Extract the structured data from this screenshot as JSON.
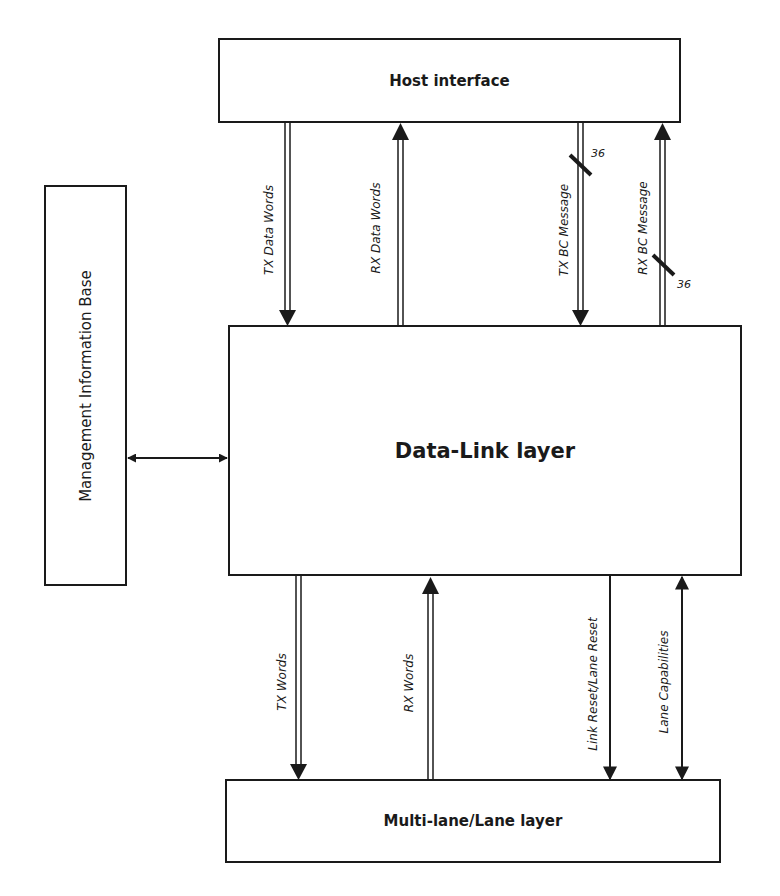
{
  "blocks": {
    "host_interface": "Host interface",
    "data_link_layer": "Data-Link layer",
    "multi_lane_layer": "Multi-lane/Lane layer",
    "management_information_base": "Management Information Base"
  },
  "signals_top": [
    {
      "label": "TX Data Words",
      "direction": "down",
      "style": "double-line"
    },
    {
      "label": "RX Data Words",
      "direction": "up",
      "style": "double-line"
    },
    {
      "label": "TX BC Message",
      "direction": "down",
      "style": "double-line",
      "bus_width": "36"
    },
    {
      "label": "RX BC Message",
      "direction": "up",
      "style": "double-line",
      "bus_width": "36"
    }
  ],
  "signals_bottom": [
    {
      "label": "TX Words",
      "direction": "down",
      "style": "double-line"
    },
    {
      "label": "RX Words",
      "direction": "up",
      "style": "double-line"
    },
    {
      "label": "Link Reset/Lane Reset",
      "direction": "down",
      "style": "single-line"
    },
    {
      "label": "Lane Capabilities",
      "direction": "bidirectional",
      "style": "single-line"
    }
  ],
  "mib_link": {
    "direction": "bidirectional"
  }
}
